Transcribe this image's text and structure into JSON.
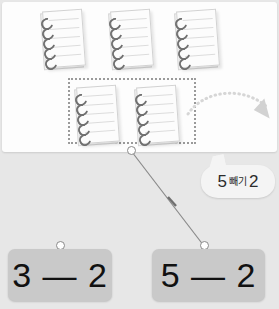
{
  "canvas": {
    "width": 279,
    "height": 309,
    "background_color": "#e7e7e7",
    "panel_color": "#fdfdfd"
  },
  "workspace": {
    "name": "notebook-workspace",
    "object_label": "notebook",
    "total_objects": 5,
    "top_row": [
      {
        "id": "notebook-1",
        "x": 40,
        "y": 8
      },
      {
        "id": "notebook-2",
        "x": 108,
        "y": 8
      },
      {
        "id": "notebook-3",
        "x": 174,
        "y": 8
      }
    ],
    "selected_row": [
      {
        "id": "notebook-4",
        "x": 74,
        "y": 84
      },
      {
        "id": "notebook-5",
        "x": 134,
        "y": 84
      }
    ],
    "selection_box": {
      "name": "dotted-selection-rectangle",
      "x": 68,
      "y": 78,
      "width": 124,
      "height": 62,
      "stroke_color": "#9a9a9a",
      "selected_count": 2
    },
    "remove_arrow": {
      "name": "curved-dotted-arrow",
      "direction": "down-right",
      "stroke_color": "#d8d8d8"
    }
  },
  "connector": {
    "name": "answer-connector-line",
    "start": {
      "x": 131,
      "y": 151
    },
    "end": {
      "x": 205,
      "y": 245
    },
    "stroke_color": "#8a8a8a",
    "start_node": "origin-node",
    "end_node": "target-node"
  },
  "answers": [
    {
      "id": "answer-tile-left",
      "expression": "3 — 2",
      "minuend": 3,
      "subtrahend": 2,
      "selected": false,
      "x": 8,
      "y": 249,
      "width": 104,
      "height": 52,
      "connector_node": {
        "x": 56,
        "y": 241
      },
      "fill_color": "#c9c9c9"
    },
    {
      "id": "answer-tile-right",
      "expression": "5 — 2",
      "minuend": 5,
      "subtrahend": 2,
      "selected": true,
      "x": 152,
      "y": 249,
      "width": 113,
      "height": 52,
      "connector_node": {
        "x": 200,
        "y": 241
      },
      "fill_color": "#c9c9c9"
    }
  ],
  "speech_bubble": {
    "name": "prompt-speech-bubble",
    "full_text": "5 빼기 2",
    "first_number": "5",
    "operator_word": "빼기",
    "second_number": "2",
    "fill_color": "#f4f4f4",
    "text_color": "#2b2b2b"
  }
}
